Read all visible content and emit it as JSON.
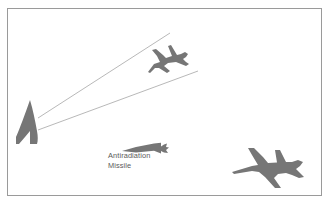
{
  "figure": {
    "type": "diagram",
    "title_visible": false,
    "background_color": "#ffffff",
    "frame": {
      "name": "figure-border",
      "x": 7,
      "y": 8,
      "width": 315,
      "height": 188,
      "stroke_color": "#9a9a9a",
      "stroke_width": 1,
      "fill": "none"
    },
    "palette": {
      "silhouette_gray": "#767676",
      "beam_gray": "#b0b0b0",
      "text_gray": "#5a5a5a",
      "border_gray": "#9a9a9a"
    }
  },
  "labels": {
    "antiradiation_missile": {
      "line1": "Antiradiation",
      "line2": "Missile",
      "x": 108,
      "y1": 158,
      "y2": 168,
      "color": "#5a5a5a"
    }
  },
  "objects": [
    {
      "id": "radar-emitter",
      "name": "radar-antenna-symbol",
      "description": "Curved blade-shaped radar antenna emitter",
      "x": 16,
      "y": 100,
      "width": 26,
      "height": 44,
      "fill": "#767676"
    },
    {
      "id": "radar-beam-upper",
      "name": "radar-beam-line-upper",
      "description": "Upper radar beam line from emitter to upper right",
      "x1": 38,
      "y1": 118,
      "x2": 170,
      "y2": 33,
      "stroke": "#b0b0b0"
    },
    {
      "id": "radar-beam-lower",
      "name": "radar-beam-line-lower",
      "description": "Lower radar beam line from emitter to mid right",
      "x1": 38,
      "y1": 130,
      "x2": 198,
      "y2": 71,
      "stroke": "#b0b0b0"
    },
    {
      "id": "aircraft-small",
      "name": "aircraft-silhouette-small",
      "description": "Small jet aircraft silhouette, upper middle, nose to lower-left",
      "x": 143,
      "y": 44,
      "width": 46,
      "height": 32,
      "fill": "#767676"
    },
    {
      "id": "missile",
      "name": "missile-silhouette",
      "description": "Antiradiation missile silhouette, nose to left, fins right",
      "x": 122,
      "y": 142,
      "width": 48,
      "height": 12,
      "fill": "#767676"
    },
    {
      "id": "aircraft-large",
      "name": "aircraft-silhouette-large",
      "description": "Large jet aircraft silhouette, bottom right, nose to left",
      "x": 232,
      "y": 148,
      "width": 84,
      "height": 44,
      "fill": "#767676"
    }
  ]
}
